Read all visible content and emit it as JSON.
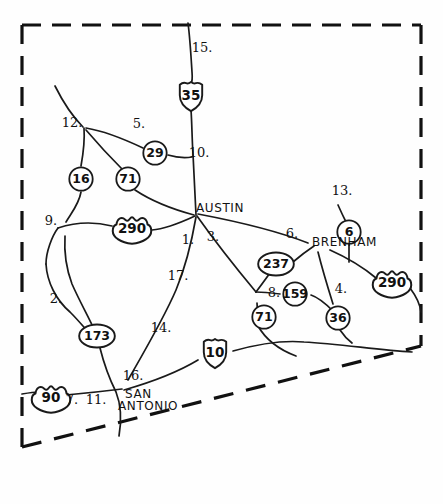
{
  "map": {
    "title": "Hand-drawn Central Texas highway network sketch",
    "background_color": "#fefefe",
    "ink_color": "#1a1a1a",
    "boundary": {
      "style": "dashed",
      "description": "dashed study-area boundary with straight top, left and right sides and a diagonal dashed bottom-right side"
    },
    "cities": [
      {
        "name": "AUSTIN",
        "x": 196,
        "y": 212
      },
      {
        "name": "BRENHAM",
        "x": 312,
        "y": 246
      },
      {
        "name": "SAN",
        "x": 125,
        "y": 398
      },
      {
        "name": "ANTONIO",
        "x": 118,
        "y": 410
      }
    ],
    "shields": [
      {
        "label": "35",
        "type": "interstate",
        "x": 191,
        "y": 96
      },
      {
        "label": "10",
        "type": "interstate",
        "x": 215,
        "y": 353
      },
      {
        "label": "290",
        "type": "us",
        "x": 132,
        "y": 230
      },
      {
        "label": "290",
        "type": "us",
        "x": 392,
        "y": 284
      },
      {
        "label": "90",
        "type": "us",
        "x": 51,
        "y": 399
      },
      {
        "label": "16",
        "type": "state",
        "x": 81,
        "y": 179
      },
      {
        "label": "71",
        "type": "state",
        "x": 128,
        "y": 179
      },
      {
        "label": "29",
        "type": "state",
        "x": 155,
        "y": 153
      },
      {
        "label": "6",
        "type": "state",
        "x": 349,
        "y": 232
      },
      {
        "label": "159",
        "type": "state",
        "x": 295,
        "y": 294
      },
      {
        "label": "71",
        "type": "state",
        "x": 264,
        "y": 317
      },
      {
        "label": "36",
        "type": "state",
        "x": 338,
        "y": 318
      },
      {
        "label": "237",
        "type": "state-oval",
        "x": 276,
        "y": 264
      },
      {
        "label": "173",
        "type": "state-oval",
        "x": 97,
        "y": 336
      }
    ],
    "segment_labels": [
      {
        "label": "1.",
        "x": 188,
        "y": 244
      },
      {
        "label": "2.",
        "x": 56,
        "y": 303
      },
      {
        "label": "3.",
        "x": 213,
        "y": 241
      },
      {
        "label": "4.",
        "x": 341,
        "y": 293
      },
      {
        "label": "5.",
        "x": 139,
        "y": 128
      },
      {
        "label": "6.",
        "x": 292,
        "y": 238
      },
      {
        "label": "7.",
        "x": 72,
        "y": 404
      },
      {
        "label": "8.",
        "x": 274,
        "y": 297
      },
      {
        "label": "9.",
        "x": 51,
        "y": 225
      },
      {
        "label": "10.",
        "x": 199,
        "y": 157
      },
      {
        "label": "11.",
        "x": 96,
        "y": 404
      },
      {
        "label": "12.",
        "x": 72,
        "y": 127
      },
      {
        "label": "13.",
        "x": 342,
        "y": 195
      },
      {
        "label": "14.",
        "x": 161,
        "y": 332
      },
      {
        "label": "15.",
        "x": 202,
        "y": 52
      },
      {
        "label": "16.",
        "x": 133,
        "y": 380
      },
      {
        "label": "17.",
        "x": 178,
        "y": 280
      }
    ]
  }
}
